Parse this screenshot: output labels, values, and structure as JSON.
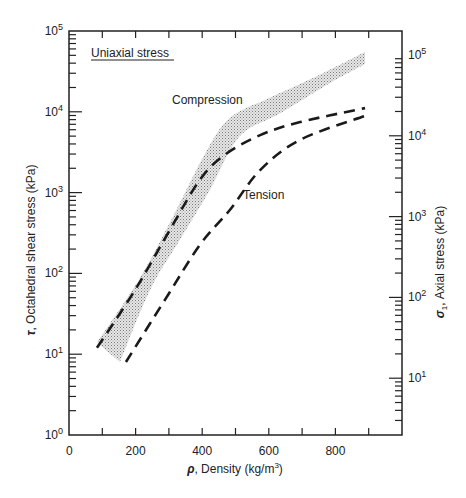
{
  "chart_data": {
    "type": "line",
    "title": "Uniaxial stress",
    "xlabel": "ρ, Density (kg/m3)",
    "xlabel_parts": {
      "symbol": "ρ",
      "text": ", Density (kg/m",
      "sup": "3",
      "end": ")"
    },
    "ylabel": "τ, Octahedral shear stress (kPa)",
    "ylabel_parts": {
      "symbol": "τ",
      "text": ", Octahedral shear stress (kPa)"
    },
    "y2label": "σ1, Axial stress (kPa)",
    "y2label_parts": {
      "symbol": "σ",
      "sub": "1",
      "text": ", Axial stress (kPa)"
    },
    "xlim": [
      0,
      1000
    ],
    "ylim": [
      1,
      100000
    ],
    "yscale": "log",
    "y2lim": [
      1,
      100000
    ],
    "y2scale": "log",
    "x_ticks": [
      0,
      100,
      200,
      300,
      400,
      500,
      600,
      700,
      800,
      900,
      1000
    ],
    "x_tick_labels": [
      "0",
      "200",
      "400",
      "600",
      "800"
    ],
    "x_tick_label_values": [
      0,
      200,
      400,
      600,
      800
    ],
    "y_tick_labels": [
      {
        "base": "10",
        "exp": "0",
        "value": 1
      },
      {
        "base": "10",
        "exp": "1",
        "value": 10
      },
      {
        "base": "10",
        "exp": "2",
        "value": 100
      },
      {
        "base": "10",
        "exp": "3",
        "value": 1000
      },
      {
        "base": "10",
        "exp": "4",
        "value": 10000
      },
      {
        "base": "10",
        "exp": "5",
        "value": 100000
      }
    ],
    "y2_tick_labels": [
      {
        "base": "10",
        "exp": "1",
        "value": 10
      },
      {
        "base": "10",
        "exp": "2",
        "value": 100
      },
      {
        "base": "10",
        "exp": "3",
        "value": 1000
      },
      {
        "base": "10",
        "exp": "4",
        "value": 10000
      },
      {
        "base": "10",
        "exp": "5",
        "value": 100000
      }
    ],
    "grid": false,
    "series": [
      {
        "name": "Compression",
        "style": "dashed",
        "x": [
          84,
          198,
          303,
          393,
          468,
          574,
          694,
          889
        ],
        "y": [
          12,
          62,
          346,
          1440,
          2930,
          5140,
          7460,
          11100
        ]
      },
      {
        "name": "Tension",
        "style": "dashed",
        "x": [
          171,
          288,
          393,
          483,
          574,
          694,
          889
        ],
        "y": [
          8,
          47,
          225,
          610,
          1900,
          4500,
          8900
        ]
      }
    ],
    "band": {
      "name": "Compression (range)",
      "style": "stippled",
      "upper": {
        "x": [
          84,
          213,
          318,
          408,
          483,
          603,
          753,
          889
        ],
        "y": [
          14,
          88,
          560,
          3000,
          8360,
          14900,
          28800,
          55000
        ]
      },
      "lower": {
        "x": [
          153,
          243,
          333,
          423,
          513,
          633,
          783,
          889
        ],
        "y": [
          8,
          62,
          260,
          1080,
          5000,
          9550,
          22600,
          39000
        ]
      }
    },
    "annotations": [
      {
        "text": "Uniaxial stress",
        "underlined": true
      },
      {
        "text": "Compression"
      },
      {
        "text": "Tension"
      }
    ]
  }
}
